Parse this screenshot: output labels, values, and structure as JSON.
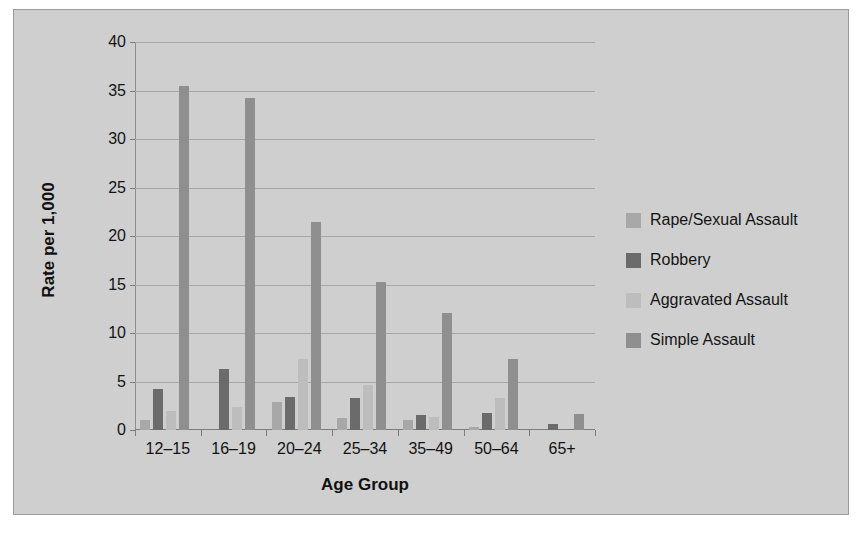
{
  "chart_data": {
    "type": "bar",
    "title": "",
    "xlabel": "Age Group",
    "ylabel": "Rate per 1,000",
    "categories": [
      "12–15",
      "16–19",
      "20–24",
      "25–34",
      "35–49",
      "50–64",
      "65+"
    ],
    "ylim": [
      0,
      40
    ],
    "yticks": [
      0,
      5,
      10,
      15,
      20,
      25,
      30,
      35,
      40
    ],
    "ytick_labels": [
      "0",
      "5",
      "10",
      "15",
      "20",
      "25",
      "30",
      "35",
      "40"
    ],
    "grid": true,
    "legend_position": "right",
    "series": [
      {
        "name": "Rape/Sexual Assault",
        "color": "#a8a8a8",
        "values": [
          1.0,
          0.0,
          2.9,
          1.2,
          1.0,
          0.3,
          0.0
        ]
      },
      {
        "name": "Robbery",
        "color": "#6b6b6b",
        "values": [
          4.2,
          6.3,
          3.4,
          3.3,
          1.5,
          1.8,
          0.6
        ]
      },
      {
        "name": "Aggravated Assault",
        "color": "#bdbdbd",
        "values": [
          2.0,
          2.4,
          7.3,
          4.6,
          1.3,
          3.3,
          0.0
        ]
      },
      {
        "name": "Simple Assault",
        "color": "#8f8f8f",
        "values": [
          35.5,
          34.2,
          21.4,
          15.3,
          12.1,
          7.3,
          1.6
        ]
      }
    ]
  },
  "style": {
    "figure_background": "#cfcfcf",
    "figure_border": "#9a9a9a",
    "gridline_color": "#a7a7a7",
    "axis_color": "#7c7c7c",
    "text_color": "#131313"
  }
}
